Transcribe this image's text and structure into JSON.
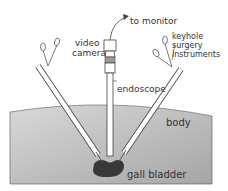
{
  "diagram": {
    "labels": {
      "to_monitor": "to monitor",
      "video_camera_line1": "video",
      "video_camera_line2": "camera",
      "keyhole_line1": "keyhole",
      "keyhole_line2": "surgery",
      "keyhole_line3": "instruments",
      "endoscope": "endoscope",
      "body": "body",
      "gall_bladder": "gall bladder"
    },
    "colors": {
      "body_gradient_top": "#d9d9d9",
      "body_gradient_bottom": "#a8a8a8",
      "gall_bladder": "#3a3a3a",
      "line": "#444444"
    }
  }
}
